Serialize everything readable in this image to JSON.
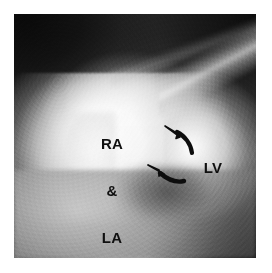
{
  "figure": {
    "kind": "radiograph",
    "modality_description": "grayscale cardiac radiograph / angiocardiogram frame",
    "plate": {
      "x": 14,
      "y": 14,
      "width": 242,
      "height": 244,
      "background_color": "#1a1a1a",
      "page_margin_color": "#ffffff"
    },
    "annotations": {
      "label_ra_la": {
        "name": "RA & LA",
        "lines": [
          "RA",
          "&",
          "LA"
        ],
        "color": "#101010",
        "x": 86,
        "y": 104
      },
      "label_lv": {
        "name": "LV",
        "text": "LV",
        "color": "#101010",
        "x": 196,
        "y": 160
      },
      "arrows": [
        {
          "id": "arrow-upper",
          "icon": "curved-arrow-icon",
          "direction": "up-left",
          "color": "#0d0d0d",
          "tip_x": 168,
          "tip_y": 130
        },
        {
          "id": "arrow-lower",
          "icon": "curved-arrow-icon",
          "direction": "left",
          "color": "#0d0d0d",
          "tip_x": 155,
          "tip_y": 168
        }
      ]
    },
    "palette": {
      "lung_field_dark": "#141414",
      "soft_tissue_mid": "#6a6a6a",
      "diaphragm_gray": "#b0b0b0",
      "contrast_bright": "#fafafa",
      "annotation_black": "#101010",
      "page_white": "#ffffff"
    }
  }
}
